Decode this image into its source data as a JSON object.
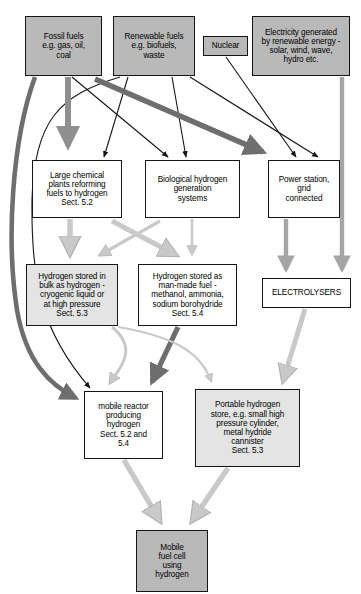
{
  "diagram": {
    "canvas": {
      "width": 361,
      "height": 594,
      "background": "#ffffff"
    },
    "palette": {
      "box_fill_gray": "#b9b9b9",
      "box_fill_white": "#ffffff",
      "box_fill_lightgray": "#e4e4e4",
      "box_border": "#151515",
      "arrow_black": "#141414",
      "arrow_dark_gray": "#6e6e6e",
      "arrow_mid_gray": "#8f8f8f",
      "arrow_light_gray": "#c9c9c9"
    },
    "nodes": [
      {
        "id": "fossil-fuels",
        "label": "Fossil fuels\ne.g. gas, oil,\ncoal",
        "fill": "gray",
        "x": 25,
        "y": 16,
        "w": 77,
        "h": 60,
        "font_size": 8.2
      },
      {
        "id": "renewable-fuels",
        "label": "Renewable fuels\ne.g. biofuels,\nwaste",
        "fill": "gray",
        "x": 113,
        "y": 16,
        "w": 82,
        "h": 60,
        "font_size": 8.2
      },
      {
        "id": "nuclear",
        "label": "Nuclear",
        "fill": "gray",
        "x": 203,
        "y": 36,
        "w": 45,
        "h": 20,
        "font_size": 8.2
      },
      {
        "id": "electricity-renewable",
        "label": "Electricity generated\nby renewable energy -\nsolar, wind, wave,\nhydro etc.",
        "fill": "gray",
        "x": 252,
        "y": 16,
        "w": 98,
        "h": 60,
        "font_size": 8.2
      },
      {
        "id": "large-chemical-plants",
        "label": "Large chemical\nplants reforming\nfuels to hydrogen\nSect. 5.2",
        "fill": "white",
        "x": 32,
        "y": 160,
        "w": 90,
        "h": 58,
        "font_size": 8.2
      },
      {
        "id": "biological-hydrogen",
        "label": "Biological hydrogen\ngeneration\nsystems",
        "fill": "white",
        "x": 145,
        "y": 160,
        "w": 95,
        "h": 58,
        "font_size": 8.2
      },
      {
        "id": "power-station",
        "label": "Power station,\ngrid\nconnected",
        "fill": "white",
        "x": 268,
        "y": 160,
        "w": 72,
        "h": 58,
        "font_size": 8.2
      },
      {
        "id": "hydrogen-stored-bulk",
        "label": "Hydrogen stored in\nbulk as hydrogen -\ncryogenic liquid or\nat high pressure\nSect. 5.3",
        "fill": "lightgray",
        "x": 26,
        "y": 264,
        "w": 92,
        "h": 62,
        "font_size": 8.2
      },
      {
        "id": "hydrogen-stored-manmade",
        "label": "Hydrogen stored as\nman-made fuel -\nmethanol, ammonia,\nsodium borohydride\nSect. 5.4",
        "fill": "white",
        "x": 138,
        "y": 264,
        "w": 99,
        "h": 62,
        "font_size": 8.2
      },
      {
        "id": "electrolysers",
        "label": "ELECTROLYSERS",
        "fill": "white",
        "x": 262,
        "y": 278,
        "w": 89,
        "h": 30,
        "font_size": 8.2
      },
      {
        "id": "mobile-reactor",
        "label": "mobile reactor\nproducing\nhydrogen\nSect. 5.2 and\n5.4",
        "fill": "white",
        "x": 84,
        "y": 391,
        "w": 79,
        "h": 68,
        "font_size": 8.2
      },
      {
        "id": "portable-hydrogen-store",
        "label": "Portable hydrogen\nstore, e.g. small high\npressure cylinder,\nmetal hydride\ncannister\nSect. 5.3",
        "fill": "lightgray",
        "x": 195,
        "y": 389,
        "w": 105,
        "h": 78,
        "font_size": 8.2
      },
      {
        "id": "mobile-fuel-cell",
        "label": "Mobile\nfuel cell\nusing\nhydrogen",
        "fill": "gray",
        "x": 136,
        "y": 530,
        "w": 72,
        "h": 62,
        "font_size": 8.2
      }
    ],
    "edges": [
      {
        "id": "fossil-to-large-chemical",
        "from": "fossil-fuels",
        "to": "large-chemical-plants",
        "style": "thick-gray",
        "color": "#8f8f8f"
      },
      {
        "id": "fossil-to-biological",
        "from": "fossil-fuels",
        "to": "biological-hydrogen",
        "style": "thin-black",
        "color": "#141414"
      },
      {
        "id": "fossil-to-power-station",
        "from": "fossil-fuels",
        "to": "power-station",
        "style": "thick-gray",
        "color": "#6e6e6e"
      },
      {
        "id": "fossil-to-mobile-reactor",
        "from": "fossil-fuels",
        "to": "mobile-reactor",
        "style": "thick-curve-gray",
        "color": "#6e6e6e"
      },
      {
        "id": "renewable-to-large-chemical",
        "from": "renewable-fuels",
        "to": "large-chemical-plants",
        "style": "thin-black",
        "color": "#141414"
      },
      {
        "id": "renewable-to-biological",
        "from": "renewable-fuels",
        "to": "biological-hydrogen",
        "style": "thin-black",
        "color": "#141414"
      },
      {
        "id": "renewable-to-power-station",
        "from": "renewable-fuels",
        "to": "power-station",
        "style": "thin-black",
        "color": "#141414"
      },
      {
        "id": "renewable-to-mobile-reactor",
        "from": "renewable-fuels",
        "to": "mobile-reactor",
        "style": "thin-curve-black",
        "color": "#141414"
      },
      {
        "id": "nuclear-to-power-station",
        "from": "nuclear",
        "to": "power-station",
        "style": "thin-black",
        "color": "#141414"
      },
      {
        "id": "electricity-to-electrolysers",
        "from": "electricity-renewable",
        "to": "electrolysers",
        "style": "thick-gray-vertical",
        "color": "#a5a5a5"
      },
      {
        "id": "large-chemical-to-stored-bulk",
        "from": "large-chemical-plants",
        "to": "hydrogen-stored-bulk",
        "style": "thick-light-gray",
        "color": "#c9c9c9"
      },
      {
        "id": "large-chemical-to-stored-manmade",
        "from": "large-chemical-plants",
        "to": "hydrogen-stored-manmade",
        "style": "thick-light-gray",
        "color": "#c9c9c9"
      },
      {
        "id": "biological-to-stored-bulk",
        "from": "biological-hydrogen",
        "to": "hydrogen-stored-bulk",
        "style": "thick-light-gray",
        "color": "#c9c9c9"
      },
      {
        "id": "biological-to-stored-manmade",
        "from": "biological-hydrogen",
        "to": "hydrogen-stored-manmade",
        "style": "thick-light-gray",
        "color": "#c9c9c9"
      },
      {
        "id": "power-station-to-electrolysers",
        "from": "power-station",
        "to": "electrolysers",
        "style": "thick-gray-vertical",
        "color": "#a5a5a5"
      },
      {
        "id": "stored-bulk-to-mobile-reactor",
        "from": "hydrogen-stored-bulk",
        "to": "mobile-reactor",
        "style": "thick-light-gray",
        "color": "#c9c9c9"
      },
      {
        "id": "stored-manmade-to-mobile-reactor",
        "from": "hydrogen-stored-manmade",
        "to": "mobile-reactor",
        "style": "thick-dark-gray",
        "color": "#6e6e6e"
      },
      {
        "id": "electrolysers-to-portable-store",
        "from": "electrolysers",
        "to": "portable-hydrogen-store",
        "style": "thick-light-gray",
        "color": "#c9c9c9"
      },
      {
        "id": "stored-bulk-to-portable-store",
        "from": "hydrogen-stored-bulk",
        "to": "portable-hydrogen-store",
        "style": "thin-curve-light",
        "color": "#c9c9c9"
      },
      {
        "id": "mobile-reactor-to-fuel-cell",
        "from": "mobile-reactor",
        "to": "mobile-fuel-cell",
        "style": "thick-light-gray",
        "color": "#c9c9c9"
      },
      {
        "id": "portable-store-to-fuel-cell",
        "from": "portable-hydrogen-store",
        "to": "mobile-fuel-cell",
        "style": "thick-light-gray",
        "color": "#c9c9c9"
      }
    ]
  }
}
